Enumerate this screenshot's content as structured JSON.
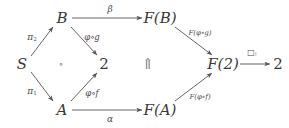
{
  "diagram": {
    "type": "commutative-diagram",
    "width": 289,
    "height": 128,
    "background_color": "#ffffff",
    "ink_color": "#3a3a3a",
    "label_color": "#4a4a4a",
    "nodes": [
      {
        "id": "S",
        "label": "S",
        "x": 22,
        "y": 64,
        "style": "italic"
      },
      {
        "id": "B",
        "label": "B",
        "x": 62,
        "y": 18,
        "style": "italic"
      },
      {
        "id": "A",
        "label": "A",
        "x": 62,
        "y": 110,
        "style": "italic"
      },
      {
        "id": "two",
        "label": "2",
        "x": 104,
        "y": 64,
        "style": "upright"
      },
      {
        "id": "FB",
        "label": "F(B)",
        "x": 160,
        "y": 18,
        "style": "italic"
      },
      {
        "id": "FA",
        "label": "F(A)",
        "x": 160,
        "y": 110,
        "style": "italic"
      },
      {
        "id": "F2",
        "label": "F(2)",
        "x": 223,
        "y": 64,
        "style": "italic"
      },
      {
        "id": "two2",
        "label": "2",
        "x": 278,
        "y": 64,
        "style": "upright"
      }
    ],
    "edges": [
      {
        "id": "S-to-B",
        "from": "S",
        "to": "B",
        "label": "π",
        "label_sub": "2",
        "label_x": 32,
        "label_y": 38,
        "label_class": "greek"
      },
      {
        "id": "S-to-A",
        "from": "S",
        "to": "A",
        "label": "π",
        "label_sub": "1",
        "label_x": 32,
        "label_y": 92,
        "label_class": "greek"
      },
      {
        "id": "B-to-2",
        "from": "B",
        "to": "two",
        "label": "φ∘g",
        "label_x": 92,
        "label_y": 37,
        "label_class": ""
      },
      {
        "id": "A-to-2",
        "from": "A",
        "to": "two",
        "label": "φ∘f",
        "label_x": 92,
        "label_y": 93,
        "label_class": ""
      },
      {
        "id": "B-to-FB",
        "from": "B",
        "to": "FB",
        "label": "β",
        "label_x": 110,
        "y": 0,
        "label_y": 9,
        "label_class": "greek"
      },
      {
        "id": "A-to-FA",
        "from": "A",
        "to": "FA",
        "label": "α",
        "label_x": 110,
        "label_y": 119,
        "label_class": "greek"
      },
      {
        "id": "FB-to-F2",
        "from": "FB",
        "to": "F2",
        "label": "F(φ∘g)",
        "label_x": 200,
        "label_y": 33,
        "label_class": "tiny"
      },
      {
        "id": "FA-to-F2",
        "from": "FA",
        "to": "F2",
        "label": "F(φ∘f)",
        "label_x": 200,
        "label_y": 97,
        "label_class": "tiny"
      },
      {
        "id": "F2-to-2",
        "from": "F2",
        "to": "two2",
        "label": "□",
        "label_sub": "!",
        "label_x": 252,
        "label_y": 53,
        "label_class": "box"
      }
    ],
    "annotations": [
      {
        "id": "composition-mark",
        "symbol": "∘",
        "x": 61,
        "y": 64
      },
      {
        "id": "two-cell-arrow",
        "symbol": "⇑",
        "x": 148,
        "y": 64
      }
    ]
  }
}
